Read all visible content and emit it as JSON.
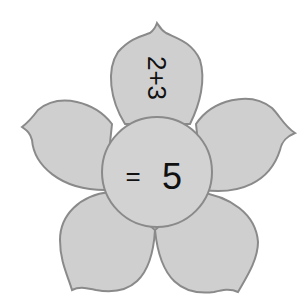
{
  "figure": {
    "type": "math flower",
    "petal_fill": "#cfcfcf",
    "petal_stroke": "#8a8a8a",
    "center_fill": "#d2d2d2",
    "text_color": "#111111"
  },
  "petals": [
    {
      "position": "top",
      "text": "2+3"
    },
    {
      "position": "right",
      "text": ""
    },
    {
      "position": "bottom-right",
      "text": ""
    },
    {
      "position": "bottom-left",
      "text": ""
    },
    {
      "position": "left",
      "text": ""
    }
  ],
  "center": {
    "equals": "=",
    "answer": "5"
  }
}
